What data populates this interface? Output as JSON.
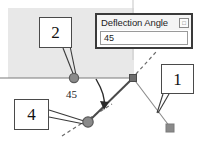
{
  "canvas": {
    "width": 203,
    "height": 146,
    "background": "#ffffff"
  },
  "shaded_panel": {
    "color": "#e8e8e8",
    "x": 8,
    "y": 8,
    "width": 126,
    "height": 70
  },
  "dialog": {
    "title": "Deflection Angle",
    "close_button_label": "□",
    "close_button_icon": "small-square-icon",
    "field_value": "45",
    "field_placeholder": "45",
    "border_color": "#3a3a3a",
    "x": 95,
    "y": 13,
    "width": 98,
    "height": 36
  },
  "callouts": [
    {
      "id": "1",
      "label": "1",
      "x": 161,
      "y": 64,
      "width": 33,
      "height": 30
    },
    {
      "id": "2",
      "label": "2",
      "x": 39,
      "y": 17,
      "width": 33,
      "height": 31
    },
    {
      "id": "4",
      "label": "4",
      "x": 14,
      "y": 99,
      "width": 35,
      "height": 31
    }
  ],
  "angle_annotation": {
    "value": "45",
    "unit": "degrees",
    "x": 66,
    "y": 89
  },
  "geometry": {
    "vertex_node": {
      "shape": "square",
      "x": 133,
      "y": 78,
      "size": 7,
      "color": "#6e6e6e"
    },
    "back_node": {
      "shape": "circle",
      "x": 74,
      "y": 78,
      "r": 4.6,
      "color": "#8a8a8a"
    },
    "ahead_node": {
      "shape": "circle",
      "x": 88,
      "y": 122,
      "r": 5.2,
      "color": "#8a8a8a"
    },
    "end_marker": {
      "shape": "square",
      "x": 170,
      "y": 128,
      "size": 8,
      "color": "#8a8a8a"
    },
    "baseline": {
      "from_x": 0,
      "from_y": 78,
      "to_x": 133,
      "to_y": 78,
      "color": "#7a7a7a"
    },
    "deflected_segment": {
      "from_x": 133,
      "from_y": 78,
      "to_x": 88,
      "to_y": 122,
      "color": "#4a4a4a"
    },
    "tangent_dashed": {
      "from_x": 62,
      "from_y": 136,
      "to_x": 112,
      "to_y": 104,
      "color": "#6a6a6a"
    },
    "upper_dashed": {
      "from_x": 136,
      "from_y": 74,
      "to_x": 156,
      "to_y": 52,
      "color": "#6a6a6a"
    },
    "branch_line": {
      "from_x": 133,
      "from_y": 78,
      "to_x": 170,
      "to_y": 127,
      "color": "#8a8a8a"
    },
    "arc_arrow": {
      "color": "#2a2a2a"
    }
  },
  "leaders": {
    "callout1_to_branch": [
      {
        "x1": 163,
        "y1": 94,
        "x2": 157,
        "y2": 113
      },
      {
        "x1": 169,
        "y1": 94,
        "x2": 158,
        "y2": 113
      }
    ],
    "callout2_to_node": [
      {
        "x1": 63,
        "y1": 48,
        "x2": 74,
        "y2": 76
      },
      {
        "x1": 70,
        "y1": 46,
        "x2": 76,
        "y2": 75
      }
    ],
    "callout4_to_node": [
      {
        "x1": 49,
        "y1": 110,
        "x2": 84,
        "y2": 121
      },
      {
        "x1": 49,
        "y1": 117,
        "x2": 84,
        "y2": 124
      }
    ]
  }
}
